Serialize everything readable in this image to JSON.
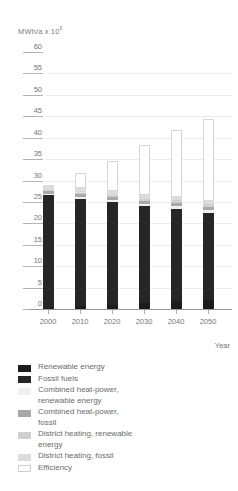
{
  "chart_data": {
    "type": "bar",
    "stacked": true,
    "title": "",
    "subtitle": "",
    "ylabel": "MWh/a x 10",
    "ylabel_exponent": "6",
    "xlabel": "Year",
    "categories": [
      "2000",
      "2010",
      "2020",
      "2030",
      "2040",
      "2050"
    ],
    "ylim": [
      0,
      60
    ],
    "yticks": [
      0,
      5,
      10,
      15,
      20,
      25,
      30,
      35,
      40,
      45,
      50,
      55,
      60
    ],
    "ytick_labels": [
      "0",
      "5",
      "10",
      "15",
      "20",
      "25",
      "30",
      "35",
      "40",
      "45",
      "50",
      "55",
      "60"
    ],
    "grid": true,
    "legend_position": "below",
    "series": [
      {
        "name": "Renewable energy",
        "color": "#1c1c1c",
        "values": [
          0.3,
          0.6,
          1.0,
          1.4,
          1.8,
          2.2
        ]
      },
      {
        "name": "Fossil fuels",
        "color": "#262626",
        "values": [
          26.4,
          25.2,
          24.0,
          22.6,
          21.6,
          20.3
        ]
      },
      {
        "name": "Combined heat-power, renewable energy",
        "color": "#f0f0f0",
        "values": [
          0.2,
          0.3,
          0.4,
          0.5,
          0.6,
          0.7
        ]
      },
      {
        "name": "Combined heat-power, fossil",
        "color": "#a8a8a8",
        "values": [
          0.7,
          0.7,
          0.7,
          0.7,
          0.7,
          0.6
        ]
      },
      {
        "name": "District heating, renewable energy",
        "color": "#cfcfcf",
        "values": [
          0.3,
          0.4,
          0.5,
          0.6,
          0.7,
          0.8
        ]
      },
      {
        "name": "District heating, fossil",
        "color": "#dcdcdc",
        "values": [
          1.1,
          1.0,
          0.9,
          0.9,
          0.8,
          0.7
        ]
      },
      {
        "name": "Efficiency",
        "color": "#ffffff",
        "values": [
          0.0,
          3.5,
          7.0,
          11.5,
          15.5,
          19.0
        ]
      }
    ],
    "totals": [
      29.0,
      31.7,
      34.5,
      38.2,
      41.7,
      44.3
    ],
    "annotations": []
  },
  "legend": {
    "items": [
      {
        "label": "Renewable energy",
        "color": "#1c1c1c",
        "outline": false
      },
      {
        "label": "Fossil fuels",
        "color": "#262626",
        "outline": false
      },
      {
        "label": "Combined heat-power,\nrenewable energy",
        "color": "#f0f0f0",
        "outline": false
      },
      {
        "label": "Combined heat-power,\nfossil",
        "color": "#a8a8a8",
        "outline": false
      },
      {
        "label": "District heating, renewable\nenergy",
        "color": "#cfcfcf",
        "outline": false
      },
      {
        "label": "District heating, fossil",
        "color": "#dcdcdc",
        "outline": false
      },
      {
        "label": "Efficiency",
        "color": "#ffffff",
        "outline": true
      }
    ]
  },
  "axes": {
    "y_caption_text": "MWh/a x 10",
    "y_caption_sup": "6",
    "x_caption_text": "Year"
  }
}
